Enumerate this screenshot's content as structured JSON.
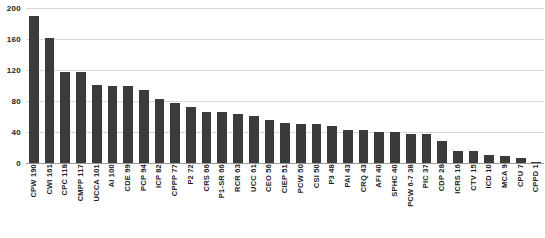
{
  "chart_data": {
    "type": "bar",
    "title": "",
    "xlabel": "",
    "ylabel": "",
    "ylim": [
      0,
      200
    ],
    "yticks": [
      0,
      40,
      80,
      120,
      160,
      200
    ],
    "grid": true,
    "legend": false,
    "bar_color": "#3b3b3b",
    "gridline_color": "#d8d8da",
    "axis_color": "#9a9a9c",
    "categories": [
      "CPW",
      "CWI",
      "CPC",
      "CMPP",
      "UCCA",
      "AI",
      "CDE",
      "PCP",
      "ICP",
      "CPPP",
      "P2",
      "CRS",
      "P1-SR",
      "RCR",
      "UCC",
      "CEO",
      "CIEP",
      "PCW",
      "CSI",
      "P3",
      "PAI",
      "CRQ",
      "AFI",
      "SPHC",
      "PCW 6-7",
      "PIC",
      "CDP",
      "ICRS",
      "CTV",
      "ICD",
      "MCA",
      "CPU",
      "CPPD"
    ],
    "values": [
      190,
      161,
      118,
      117,
      101,
      100,
      99,
      94,
      82,
      77,
      72,
      66,
      66,
      63,
      61,
      56,
      51,
      50,
      50,
      48,
      43,
      43,
      40,
      40,
      38,
      37,
      28,
      16,
      15,
      10,
      9,
      7,
      1
    ],
    "tick_labels": [
      "CPW 190",
      "CWI 161",
      "CPC 118",
      "CMPP 117",
      "UCCA 101",
      "AI 100",
      "CDE 99",
      "PCP 94",
      "ICP 82",
      "CPPP 77",
      "P2 72",
      "CRS 66",
      "P1-SR 66",
      "RCR 63",
      "UCC 61",
      "CEO 56",
      "CIEP 51",
      "PCW 50",
      "CSI 50",
      "P3 48",
      "PAI 43",
      "CRQ 43",
      "AFI 40",
      "SPHC 40",
      "PCW 6-7 38",
      "PIC 37",
      "CDP 28",
      "ICRS 16",
      "CTV 15",
      "ICD 10",
      "MCA 9",
      "CPU 7",
      "CPPD 1"
    ]
  },
  "title_sliver": {
    "text": ""
  }
}
